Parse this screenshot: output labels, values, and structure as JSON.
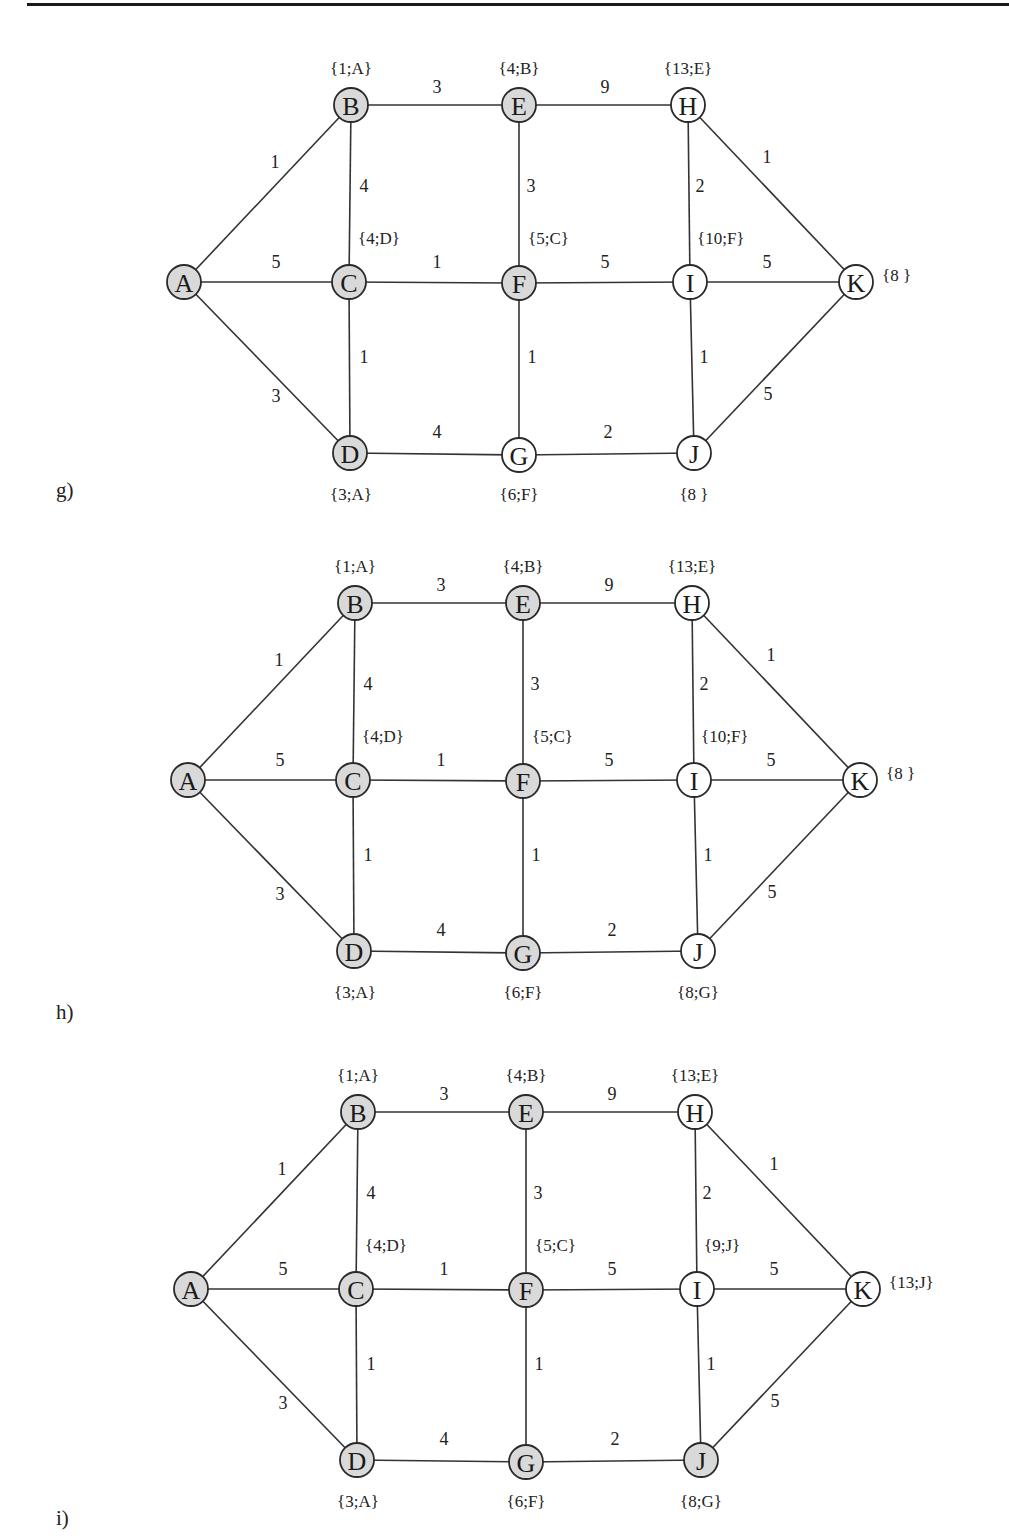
{
  "colors": {
    "visited": "#d9d9d9",
    "unvisited": "#ffffff",
    "stroke": "#2a2a2a"
  },
  "edges": [
    {
      "from": "A",
      "to": "B",
      "w": "1"
    },
    {
      "from": "A",
      "to": "C",
      "w": "5"
    },
    {
      "from": "A",
      "to": "D",
      "w": "3"
    },
    {
      "from": "B",
      "to": "E",
      "w": "3"
    },
    {
      "from": "B",
      "to": "C",
      "w": "4"
    },
    {
      "from": "C",
      "to": "F",
      "w": "1"
    },
    {
      "from": "C",
      "to": "D",
      "w": "1"
    },
    {
      "from": "D",
      "to": "G",
      "w": "4"
    },
    {
      "from": "E",
      "to": "H",
      "w": "9"
    },
    {
      "from": "E",
      "to": "F",
      "w": "3"
    },
    {
      "from": "F",
      "to": "I",
      "w": "5"
    },
    {
      "from": "F",
      "to": "G",
      "w": "1"
    },
    {
      "from": "G",
      "to": "J",
      "w": "2"
    },
    {
      "from": "H",
      "to": "I",
      "w": "2"
    },
    {
      "from": "H",
      "to": "K",
      "w": "1"
    },
    {
      "from": "I",
      "to": "K",
      "w": "5"
    },
    {
      "from": "I",
      "to": "J",
      "w": "1"
    },
    {
      "from": "J",
      "to": "K",
      "w": "5"
    }
  ],
  "panels": [
    {
      "id": "g",
      "caption": "g)",
      "nodes": {
        "A": {
          "visited": true,
          "label": ""
        },
        "B": {
          "visited": true,
          "label": "{1;A}"
        },
        "C": {
          "visited": true,
          "label": "{4;D}"
        },
        "D": {
          "visited": true,
          "label": "{3;A}"
        },
        "E": {
          "visited": true,
          "label": "{4;B}"
        },
        "F": {
          "visited": true,
          "label": "{5;C}"
        },
        "G": {
          "visited": false,
          "label": "{6;F}"
        },
        "H": {
          "visited": false,
          "label": "{13;E}"
        },
        "I": {
          "visited": false,
          "label": "{10;F}"
        },
        "J": {
          "visited": false,
          "label": "{8 }"
        },
        "K": {
          "visited": false,
          "label": "{8 }"
        }
      }
    },
    {
      "id": "h",
      "caption": "h)",
      "nodes": {
        "A": {
          "visited": true,
          "label": ""
        },
        "B": {
          "visited": true,
          "label": "{1;A}"
        },
        "C": {
          "visited": true,
          "label": "{4;D}"
        },
        "D": {
          "visited": true,
          "label": "{3;A}"
        },
        "E": {
          "visited": true,
          "label": "{4;B}"
        },
        "F": {
          "visited": true,
          "label": "{5;C}"
        },
        "G": {
          "visited": true,
          "label": "{6;F}"
        },
        "H": {
          "visited": false,
          "label": "{13;E}"
        },
        "I": {
          "visited": false,
          "label": "{10;F}"
        },
        "J": {
          "visited": false,
          "label": "{8;G}"
        },
        "K": {
          "visited": false,
          "label": "{8 }"
        }
      }
    },
    {
      "id": "i",
      "caption": "i)",
      "nodes": {
        "A": {
          "visited": true,
          "label": ""
        },
        "B": {
          "visited": true,
          "label": "{1;A}"
        },
        "C": {
          "visited": true,
          "label": "{4;D}"
        },
        "D": {
          "visited": true,
          "label": "{3;A}"
        },
        "E": {
          "visited": true,
          "label": "{4;B}"
        },
        "F": {
          "visited": true,
          "label": "{5;C}"
        },
        "G": {
          "visited": true,
          "label": "{6;F}"
        },
        "H": {
          "visited": false,
          "label": "{13;E}"
        },
        "I": {
          "visited": false,
          "label": "{9;J}"
        },
        "J": {
          "visited": true,
          "label": "{8;G}"
        },
        "K": {
          "visited": false,
          "label": "{13;J}"
        }
      }
    }
  ]
}
